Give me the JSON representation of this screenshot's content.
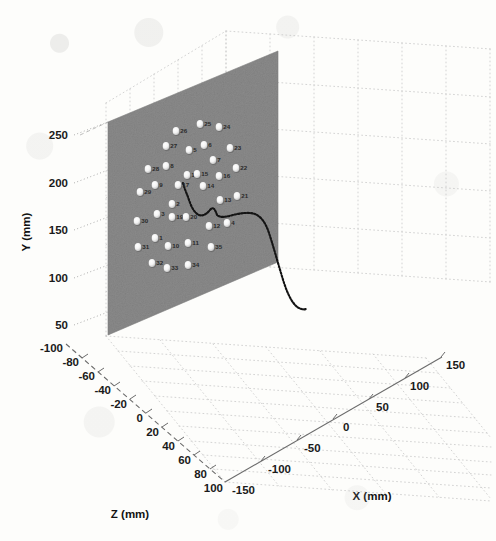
{
  "figure": {
    "kind": "matlab-3d-scatter-plot",
    "background_color": "#fdfdfb",
    "plane_color": "#8a8a8a",
    "marker_color": "#f2f2f2",
    "trajectory_color": "#1a1a1a",
    "grid_color": "#c9c9c9",
    "axis_color": "#555555"
  },
  "axes": {
    "y": {
      "title": "Y (mm)",
      "ticks": [
        "250",
        "200",
        "150",
        "100",
        "50"
      ],
      "values": [
        250,
        200,
        150,
        100,
        50
      ],
      "range": [
        50,
        250
      ]
    },
    "z": {
      "title": "Z (mm)",
      "ticks": [
        "-100",
        "-80",
        "-60",
        "-40",
        "-20",
        "0",
        "20",
        "40",
        "60",
        "80",
        "100"
      ],
      "values": [
        -100,
        -80,
        -60,
        -40,
        -20,
        0,
        20,
        40,
        60,
        80,
        100
      ],
      "range": [
        -100,
        100
      ]
    },
    "x": {
      "title": "X (mm)",
      "ticks": [
        "-150",
        "-100",
        "-50",
        "0",
        "50",
        "100",
        "150"
      ],
      "values": [
        -150,
        -100,
        -50,
        0,
        50,
        100,
        150
      ],
      "range": [
        -150,
        150
      ]
    }
  },
  "chart_data": {
    "type": "scatter",
    "title": "",
    "xlabel": "X (mm)",
    "ylabel": "Y (mm)",
    "zlabel": "Z (mm)",
    "xlim": [
      -150,
      150
    ],
    "ylim": [
      50,
      250
    ],
    "zlim": [
      -100,
      100
    ],
    "grid": true,
    "legend": null,
    "series": [
      {
        "name": "numbered-targets-on-plane",
        "style": "white circular markers with numeric labels on a grey plane",
        "marker_labels": [
          "1",
          "2",
          "3",
          "4",
          "5",
          "6",
          "7",
          "8",
          "9",
          "10",
          "11",
          "12",
          "13",
          "14",
          "15",
          "16",
          "17",
          "18",
          "19",
          "20",
          "21",
          "22",
          "23",
          "24",
          "25",
          "26",
          "27",
          "28",
          "29",
          "30",
          "31",
          "32",
          "33",
          "34",
          "35"
        ],
        "points_px": [
          {
            "label": "26",
            "cx": 176,
            "cy": 131
          },
          {
            "label": "25",
            "cx": 200,
            "cy": 124
          },
          {
            "label": "24",
            "cx": 219,
            "cy": 127
          },
          {
            "label": "27",
            "cx": 166,
            "cy": 146
          },
          {
            "label": "5",
            "cx": 189,
            "cy": 150
          },
          {
            "label": "6",
            "cx": 204,
            "cy": 145
          },
          {
            "label": "23",
            "cx": 230,
            "cy": 148
          },
          {
            "label": "7",
            "cx": 213,
            "cy": 160
          },
          {
            "label": "28",
            "cx": 148,
            "cy": 169
          },
          {
            "label": "8",
            "cx": 166,
            "cy": 166
          },
          {
            "label": "18",
            "cx": 187,
            "cy": 175
          },
          {
            "label": "15",
            "cx": 197,
            "cy": 174
          },
          {
            "label": "22",
            "cx": 236,
            "cy": 168
          },
          {
            "label": "16",
            "cx": 219,
            "cy": 176
          },
          {
            "label": "29",
            "cx": 140,
            "cy": 192
          },
          {
            "label": "9",
            "cx": 155,
            "cy": 185
          },
          {
            "label": "17",
            "cx": 178,
            "cy": 185
          },
          {
            "label": "14",
            "cx": 203,
            "cy": 186
          },
          {
            "label": "2",
            "cx": 172,
            "cy": 204
          },
          {
            "label": "13",
            "cx": 220,
            "cy": 200
          },
          {
            "label": "21",
            "cx": 237,
            "cy": 196
          },
          {
            "label": "3",
            "cx": 157,
            "cy": 214
          },
          {
            "label": "19",
            "cx": 172,
            "cy": 217
          },
          {
            "label": "20",
            "cx": 186,
            "cy": 217
          },
          {
            "label": "30",
            "cx": 137,
            "cy": 221
          },
          {
            "label": "12",
            "cx": 209,
            "cy": 226
          },
          {
            "label": "4",
            "cx": 227,
            "cy": 223
          },
          {
            "label": "1",
            "cx": 155,
            "cy": 238
          },
          {
            "label": "31",
            "cx": 138,
            "cy": 247
          },
          {
            "label": "10",
            "cx": 168,
            "cy": 246
          },
          {
            "label": "11",
            "cx": 188,
            "cy": 243
          },
          {
            "label": "35",
            "cx": 211,
            "cy": 247
          },
          {
            "label": "32",
            "cx": 152,
            "cy": 263
          },
          {
            "label": "33",
            "cx": 167,
            "cy": 268
          },
          {
            "label": "34",
            "cx": 188,
            "cy": 265
          }
        ]
      },
      {
        "name": "probe-trajectory",
        "style": "black dotted curve",
        "path_px": [
          [
            183,
            183
          ],
          [
            185,
            186
          ],
          [
            187,
            190
          ],
          [
            188,
            194
          ],
          [
            189,
            198
          ],
          [
            190,
            202
          ],
          [
            192,
            206
          ],
          [
            194,
            210
          ],
          [
            196,
            213
          ],
          [
            199,
            215
          ],
          [
            202,
            216
          ],
          [
            205,
            214
          ],
          [
            208,
            212
          ],
          [
            210,
            209
          ],
          [
            212,
            207
          ],
          [
            214,
            208
          ],
          [
            215,
            211
          ],
          [
            216,
            214
          ],
          [
            218,
            216
          ],
          [
            221,
            217
          ],
          [
            225,
            217
          ],
          [
            229,
            216
          ],
          [
            233,
            215
          ],
          [
            237,
            214
          ],
          [
            241,
            213
          ],
          [
            245,
            212
          ],
          [
            249,
            212
          ],
          [
            253,
            213
          ],
          [
            257,
            215
          ],
          [
            261,
            218
          ],
          [
            264,
            222
          ],
          [
            267,
            227
          ],
          [
            269,
            232
          ],
          [
            271,
            238
          ],
          [
            273,
            245
          ],
          [
            275,
            252
          ],
          [
            277,
            259
          ],
          [
            279,
            266
          ],
          [
            281,
            273
          ],
          [
            283,
            280
          ],
          [
            285,
            287
          ],
          [
            287,
            293
          ],
          [
            290,
            299
          ],
          [
            293,
            304
          ],
          [
            297,
            307
          ],
          [
            301,
            309
          ],
          [
            305,
            309
          ]
        ]
      }
    ]
  },
  "plane": {
    "name": "calibration-plate",
    "corners_px": [
      [
        108,
        122
      ],
      [
        278,
        51
      ],
      [
        278,
        262
      ],
      [
        108,
        335
      ]
    ]
  }
}
